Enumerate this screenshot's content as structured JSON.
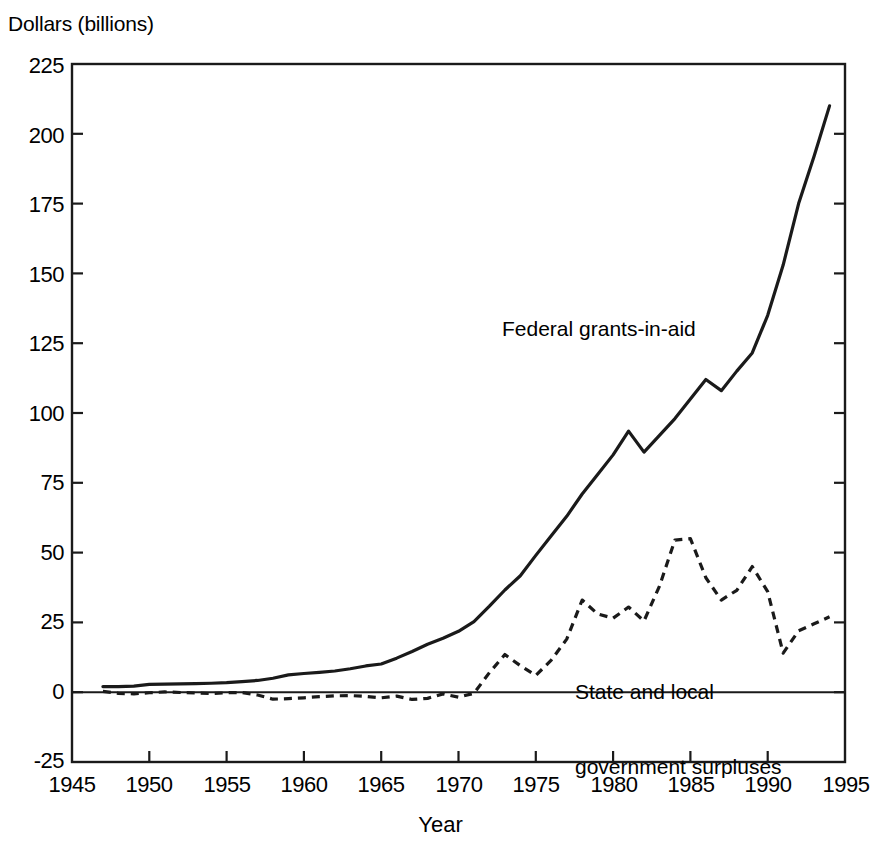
{
  "figure": {
    "background_color": "#ffffff",
    "ink_color": "#1a1a1a"
  },
  "axes": {
    "y_axis_title": "Dollars (billions)",
    "x_axis_title": "Year",
    "y_ticks": [
      "225",
      "200",
      "175",
      "150",
      "125",
      "100",
      "75",
      "50",
      "25",
      "0",
      "-25"
    ],
    "x_ticks": [
      "1945",
      "1950",
      "1955",
      "1960",
      "1965",
      "1970",
      "1975",
      "1980",
      "1985",
      "1990",
      "1995"
    ]
  },
  "annotations": {
    "federal_label": "Federal grants-in-aid",
    "state_label_line1": "State and local",
    "state_label_line2": "government surpluses"
  },
  "chart_data": {
    "type": "line",
    "title": "",
    "subtitle": "",
    "xlabel": "Year",
    "ylabel": "Dollars (billions)",
    "xlim": [
      1945,
      1995
    ],
    "ylim": [
      -25,
      225
    ],
    "ytick_step": 25,
    "xtick_step": 5,
    "grid": false,
    "legend_position": "inline-annotation",
    "zero_reference_line": true,
    "x": [
      1947,
      1948,
      1949,
      1950,
      1951,
      1952,
      1953,
      1954,
      1955,
      1956,
      1957,
      1958,
      1959,
      1960,
      1961,
      1962,
      1963,
      1964,
      1965,
      1966,
      1967,
      1968,
      1969,
      1970,
      1971,
      1972,
      1973,
      1974,
      1975,
      1976,
      1977,
      1978,
      1979,
      1980,
      1981,
      1982,
      1983,
      1984,
      1985,
      1986,
      1987,
      1988,
      1989,
      1990,
      1991,
      1992,
      1993,
      1994
    ],
    "series": [
      {
        "name": "Federal grants-in-aid",
        "style": "solid",
        "color": "#1a1a1a",
        "values": [
          2.0,
          2.0,
          2.2,
          2.8,
          2.9,
          3.0,
          3.1,
          3.2,
          3.4,
          3.8,
          4.2,
          5.0,
          6.2,
          6.7,
          7.1,
          7.6,
          8.4,
          9.4,
          10.1,
          12.2,
          14.6,
          17.2,
          19.3,
          21.8,
          25.3,
          30.8,
          36.6,
          41.7,
          49.0,
          56.0,
          63.0,
          71.0,
          78.0,
          85.0,
          93.5,
          86.0,
          92.0,
          98.0,
          105.0,
          112.0,
          108.0,
          115.0,
          121.5,
          135.0,
          153.0,
          175.0,
          192.0,
          210.0
        ]
      },
      {
        "name": "State and local government surpluses",
        "style": "dashed",
        "color": "#1a1a1a",
        "values": [
          0.3,
          -0.4,
          -0.6,
          -0.2,
          0.1,
          -0.1,
          -0.3,
          -0.5,
          -0.2,
          -0.1,
          -1.0,
          -2.5,
          -2.3,
          -2.0,
          -1.6,
          -1.3,
          -1.2,
          -1.5,
          -2.0,
          -1.4,
          -2.6,
          -2.2,
          -0.6,
          -1.8,
          -0.4,
          7.0,
          13.5,
          9.5,
          6.0,
          11.5,
          19.0,
          33.0,
          28.0,
          26.5,
          30.5,
          25.5,
          38.0,
          54.5,
          55.0,
          41.0,
          33.0,
          36.5,
          45.0,
          36.0,
          14.0,
          22.0,
          24.5,
          27.0
        ]
      }
    ]
  }
}
